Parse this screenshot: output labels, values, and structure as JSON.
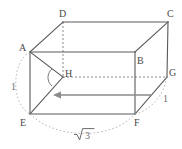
{
  "figure": {
    "kind": "geometry-diagram",
    "background_color": "#ffffff",
    "edge_color": "#5a5a5a",
    "hidden_edge_color": "#8a8a8a",
    "arc_color": "#b0b0b0",
    "arrow_color": "#8a8a8a",
    "label_color": "#4a4a4a",
    "measure_color": "#6b6b6b",
    "vertices": [
      {
        "name": "A",
        "label": "A",
        "x": 30,
        "y": 52,
        "label_x": 19,
        "label_y": 43
      },
      {
        "name": "B",
        "label": "B",
        "x": 135,
        "y": 52,
        "label_x": 137,
        "label_y": 56
      },
      {
        "name": "C",
        "label": "C",
        "x": 168,
        "y": 22,
        "label_x": 167,
        "label_y": 9
      },
      {
        "name": "D",
        "label": "D",
        "x": 63,
        "y": 22,
        "label_x": 59,
        "label_y": 9
      },
      {
        "name": "E",
        "label": "E",
        "x": 30,
        "y": 114,
        "label_x": 20,
        "label_y": 118
      },
      {
        "name": "F",
        "label": "F",
        "x": 135,
        "y": 114,
        "label_x": 134,
        "label_y": 118
      },
      {
        "name": "G",
        "label": "G",
        "x": 167,
        "y": 77,
        "label_x": 169,
        "label_y": 68
      },
      {
        "name": "H",
        "label": "H",
        "x": 63,
        "y": 77,
        "label_x": 65,
        "label_y": 69
      }
    ],
    "solid_edges": [
      {
        "name": "edge-AB",
        "from": "A",
        "to": "B"
      },
      {
        "name": "edge-BF",
        "from": "B",
        "to": "F"
      },
      {
        "name": "edge-FE",
        "from": "F",
        "to": "E"
      },
      {
        "name": "edge-EA",
        "from": "E",
        "to": "A"
      },
      {
        "name": "edge-AD",
        "from": "A",
        "to": "D"
      },
      {
        "name": "edge-BC",
        "from": "B",
        "to": "C"
      },
      {
        "name": "edge-FG",
        "from": "F",
        "to": "G"
      },
      {
        "name": "edge-DC",
        "from": "D",
        "to": "C"
      },
      {
        "name": "edge-CG",
        "from": "C",
        "to": "G"
      },
      {
        "name": "diagonal-AH",
        "from": "A",
        "to": "H"
      },
      {
        "name": "diagonal-HE",
        "from": "H",
        "to": "E"
      }
    ],
    "hidden_edges": [
      {
        "name": "hidden-edge-DH",
        "from": "D",
        "to": "H"
      },
      {
        "name": "hidden-edge-HG",
        "from": "H",
        "to": "G"
      }
    ],
    "angle_marker": {
      "name": "angle-at-H",
      "at": "H",
      "radius": 11
    },
    "arrow": {
      "name": "direction-arrow",
      "x1": 152,
      "y1": 95,
      "x2": 55,
      "y2": 95,
      "head": "left"
    },
    "measures": [
      {
        "name": "measure-left-height",
        "text": "1",
        "x": 11,
        "y": 82
      },
      {
        "name": "measure-right-depth",
        "text": "1",
        "x": 163,
        "y": 94
      },
      {
        "name": "measure-bottom-width",
        "text": "3",
        "radical": "√",
        "x": 74,
        "y": 127
      }
    ],
    "arcs": [
      {
        "name": "arc-left-height",
        "d": "M 30 52 C 11 62, 11 104, 30 114"
      },
      {
        "name": "arc-bottom-width",
        "d": "M 30 114 C 56 140, 112 140, 135 114"
      },
      {
        "name": "arc-right-depth",
        "d": "M 135 114 C 152 110, 164 94, 167 77"
      }
    ]
  }
}
